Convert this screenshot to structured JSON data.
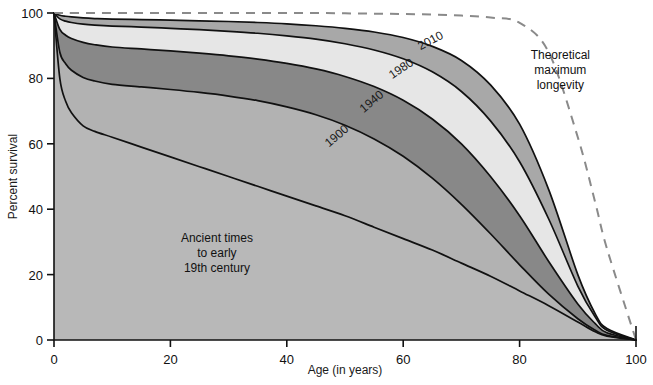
{
  "chart_data": {
    "type": "area",
    "title": "",
    "xlabel": "Age (in years)",
    "ylabel": "Percent survival",
    "xlim": [
      0,
      100
    ],
    "ylim": [
      0,
      100
    ],
    "xticks": [
      "0",
      "20",
      "40",
      "60",
      "80",
      "100"
    ],
    "yticks": [
      "0",
      "20",
      "40",
      "60",
      "80",
      "100"
    ],
    "grid": false,
    "legend_position": "inline-curve-labels",
    "x": [
      0,
      1,
      2,
      3,
      5,
      7,
      10,
      15,
      20,
      25,
      30,
      35,
      40,
      45,
      50,
      55,
      60,
      65,
      70,
      75,
      80,
      85,
      90,
      93,
      95,
      100
    ],
    "series": [
      {
        "name": "2010",
        "label": "2010",
        "fill": "#a8a8a8",
        "values": [
          100,
          99.3,
          99.0,
          98.8,
          98.5,
          98.3,
          98.1,
          98.0,
          97.8,
          97.6,
          97.4,
          97.1,
          96.7,
          96.1,
          95.3,
          94.2,
          92.5,
          89.8,
          85.5,
          78.0,
          66.0,
          46.0,
          20.0,
          8.0,
          3.5,
          0
        ]
      },
      {
        "name": "1980",
        "label": "1980",
        "fill": "#e6e6e6",
        "values": [
          100,
          98.2,
          97.5,
          97.1,
          96.6,
          96.3,
          96.0,
          95.7,
          95.3,
          94.9,
          94.4,
          93.8,
          93.0,
          92.0,
          90.6,
          88.7,
          86.0,
          82.0,
          76.0,
          67.0,
          54.5,
          37.0,
          16.5,
          7.0,
          3.0,
          0
        ]
      },
      {
        "name": "1940",
        "label": "1940",
        "fill": "#888888",
        "values": [
          100,
          95.0,
          93.2,
          92.2,
          91.0,
          90.3,
          89.6,
          89.0,
          88.4,
          87.7,
          86.9,
          85.9,
          84.6,
          82.9,
          80.6,
          77.5,
          73.3,
          67.6,
          60.0,
          50.0,
          38.0,
          24.0,
          11.0,
          5.0,
          2.2,
          0
        ]
      },
      {
        "name": "1900",
        "label": "1900",
        "fill": "#b2b2b2",
        "values": [
          100,
          88.0,
          84.5,
          82.5,
          80.3,
          79.2,
          78.2,
          77.4,
          76.6,
          75.7,
          74.6,
          73.2,
          71.3,
          68.9,
          65.7,
          61.5,
          56.2,
          49.5,
          41.5,
          32.5,
          23.0,
          14.0,
          6.5,
          3.0,
          1.4,
          0
        ]
      },
      {
        "name": "ancient",
        "label": "Ancient times to early 19th century",
        "fill": "#b8b8b8",
        "values": [
          100,
          80.0,
          73.0,
          69.5,
          65.5,
          63.8,
          62.0,
          59.0,
          56.0,
          53.0,
          50.0,
          47.0,
          44.0,
          41.0,
          38.0,
          34.5,
          31.0,
          27.5,
          23.5,
          19.5,
          15.0,
          10.5,
          5.5,
          2.5,
          1.2,
          0
        ]
      }
    ],
    "theoretical": {
      "name": "theoretical-maximum-longevity",
      "label": "Theoretical maximum longevity",
      "style": "dashed",
      "color": "#8a8a8a",
      "values": [
        100,
        100,
        100,
        100,
        100,
        100,
        100,
        100,
        100,
        100,
        100,
        100,
        100,
        100,
        99.9,
        99.8,
        99.7,
        99.5,
        99.2,
        98.6,
        97.0,
        88.0,
        62.0,
        42.0,
        28.0,
        0
      ]
    },
    "annotations": [
      {
        "name": "ancient-times-annotation",
        "lines": [
          "Ancient times",
          "to early",
          "19th century"
        ],
        "x": 28,
        "y": 30
      },
      {
        "name": "theoretical-annotation",
        "lines": [
          "Theoretical",
          "maximum",
          "longevity"
        ],
        "x": 87,
        "y": 86
      }
    ],
    "curve_labels": [
      {
        "name": "curve-label-2010",
        "text": "2010",
        "x": 65,
        "y": 90.5,
        "rotate": -28
      },
      {
        "name": "curve-label-1980",
        "text": "1980",
        "x": 60,
        "y": 82.0,
        "rotate": -34
      },
      {
        "name": "curve-label-1940",
        "text": "1940",
        "x": 55,
        "y": 72.0,
        "rotate": -40
      },
      {
        "name": "curve-label-1900",
        "text": "1900",
        "x": 49,
        "y": 61.5,
        "rotate": -40
      }
    ]
  }
}
